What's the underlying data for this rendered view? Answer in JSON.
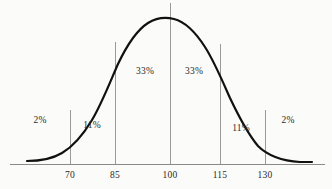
{
  "figure": {
    "alt_title": "Normal distribution bell curve with standard score percentages",
    "background_color": "#fbfbf9",
    "curve_color": "#111111",
    "axis_color": "#8a8a8a",
    "divider_color": "#9a9a9a",
    "text_color": "#2b2b2b"
  },
  "chart_data": {
    "type": "line",
    "title": "",
    "subtitle": "",
    "xlabel": "",
    "ylabel": "",
    "grid": false,
    "legend": false,
    "legend_position": "none",
    "distribution": "normal",
    "mean": 100,
    "std_dev": 15,
    "xlim": [
      55,
      145
    ],
    "ylim": [
      0,
      1
    ],
    "x_ticks": [
      {
        "value": 70,
        "label": "70",
        "px": 70,
        "divider_top_px": 110,
        "divider_bottom_px": 164
      },
      {
        "value": 85,
        "label": "85",
        "px": 115,
        "divider_top_px": 42,
        "divider_bottom_px": 164
      },
      {
        "value": 100,
        "label": "100",
        "px": 170,
        "divider_top_px": 3,
        "divider_bottom_px": 164
      },
      {
        "value": 115,
        "label": "115",
        "px": 220,
        "divider_top_px": 44,
        "divider_bottom_px": 164
      },
      {
        "value": 130,
        "label": "130",
        "px": 265,
        "divider_top_px": 110,
        "divider_bottom_px": 164
      }
    ],
    "regions": [
      {
        "label": "2%",
        "value": 2,
        "range": [
          null,
          70
        ],
        "center_px": 40,
        "center_py": 120
      },
      {
        "label": "11%",
        "value": 11,
        "range": [
          70,
          85
        ],
        "center_px": 92,
        "center_py": 125
      },
      {
        "label": "33%",
        "value": 33,
        "range": [
          85,
          100
        ],
        "center_px": 145,
        "center_py": 71
      },
      {
        "label": "33%",
        "value": 33,
        "range": [
          100,
          115
        ],
        "center_px": 194,
        "center_py": 71
      },
      {
        "label": "11%",
        "value": 11,
        "range": [
          115,
          130
        ],
        "center_px": 241,
        "center_py": 128
      },
      {
        "label": "2%",
        "value": 2,
        "range": [
          130,
          null
        ],
        "center_px": 288,
        "center_py": 120
      }
    ],
    "curve": {
      "peak_px": {
        "x": 170,
        "y": 20
      },
      "baseline_py": 164,
      "left_end_px": 27,
      "right_end_px": 312,
      "path": "M 27 161 C 40 161 52 159 62 153 C 74 146 83 135 92 120 C 102 103 110 82 118 64 C 127 45 137 30 148 23 C 156 18 166 17 174 19 C 186 22 196 33 205 47 C 214 61 222 80 230 98 C 239 117 248 134 258 146 C 268 156 284 161 300 162 C 305 162 309 162 312 162"
    }
  },
  "axis": {
    "baseline": {
      "x1": 10,
      "x2": 325,
      "y": 164
    }
  }
}
